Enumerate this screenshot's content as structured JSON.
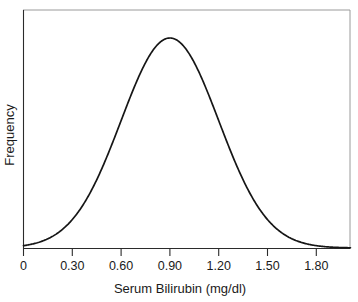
{
  "chart_data": {
    "type": "line",
    "title": "",
    "subtitle": "",
    "xlabel": "Serum Bilirubin (mg/dl)",
    "ylabel": "Frequency",
    "grid": false,
    "legend": null,
    "xlim": [
      0,
      2.01
    ],
    "ylim": [
      0,
      1.05
    ],
    "xticks": [
      0,
      0.3,
      0.6,
      0.9,
      1.2,
      1.5,
      1.8
    ],
    "xtick_labels": [
      "0",
      "0.30",
      "0.60",
      "0.90",
      "1.20",
      "1.50",
      "1.80"
    ],
    "yticks": [],
    "ytick_labels": [],
    "distribution": {
      "shape": "normal",
      "mean": 0.9,
      "sigma": 0.3,
      "peak_x": 0.9,
      "peak_y": 1.0
    },
    "series": [
      {
        "name": "Frequency",
        "color": "#161616",
        "x": [
          0.0,
          0.05,
          0.1,
          0.15,
          0.2,
          0.25,
          0.3,
          0.35,
          0.4,
          0.45,
          0.5,
          0.55,
          0.6,
          0.65,
          0.7,
          0.75,
          0.8,
          0.85,
          0.9,
          0.95,
          1.0,
          1.05,
          1.1,
          1.15,
          1.2,
          1.25,
          1.3,
          1.35,
          1.4,
          1.45,
          1.5,
          1.55,
          1.6,
          1.65,
          1.7,
          1.75,
          1.8,
          1.85,
          1.9,
          1.95,
          2.0
        ],
        "values": [
          0.011,
          0.019,
          0.032,
          0.051,
          0.08,
          0.121,
          0.174,
          0.242,
          0.325,
          0.42,
          0.527,
          0.638,
          0.747,
          0.846,
          0.926,
          0.98,
          1.0,
          0.986,
          1.0,
          0.986,
          1.0,
          0.98,
          0.926,
          0.846,
          0.747,
          0.638,
          0.527,
          0.42,
          0.325,
          0.242,
          0.174,
          0.121,
          0.08,
          0.051,
          0.032,
          0.019,
          0.011,
          0.006,
          0.003,
          0.002,
          0.001
        ]
      }
    ]
  },
  "axes": {
    "x_axis_label": "Serum Bilirubin (mg/dl)",
    "y_axis_label": "Frequency",
    "tick_labels": [
      "0",
      "0.30",
      "0.60",
      "0.90",
      "1.20",
      "1.50",
      "1.80"
    ]
  },
  "colors": {
    "curve": "#161616",
    "axis": "#2b2b2b",
    "frame": "#9a9a9a",
    "text": "#1a1a1a",
    "background": "#ffffff"
  }
}
